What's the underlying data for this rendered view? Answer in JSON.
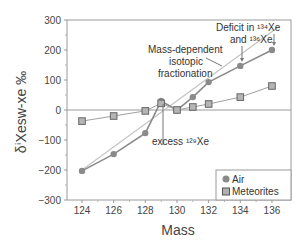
{
  "chart_data": {
    "type": "line",
    "title": "",
    "xlabel": "Mass",
    "ylabel": "δⁱXesw-xe ‰",
    "xlim": [
      123.1,
      137.1
    ],
    "ylim": [
      -300,
      300
    ],
    "x_ticks": [
      124,
      126,
      128,
      130,
      132,
      134,
      136
    ],
    "y_ticks": [
      300,
      200,
      100,
      0,
      -100,
      -200,
      -300
    ],
    "grid": false,
    "zero_line": true,
    "legend_position": "lower right",
    "series": [
      {
        "name": "Air",
        "marker": "circle",
        "color": "#8a8a8a",
        "x": [
          124,
          126,
          128,
          129,
          130,
          131,
          132,
          134,
          136
        ],
        "values": [
          -203,
          -147,
          -77,
          30,
          0,
          43,
          93,
          147,
          200
        ]
      },
      {
        "name": "Meteorites",
        "marker": "square",
        "color": "#a0a0a0",
        "x": [
          124,
          126,
          128,
          129,
          130,
          131,
          132,
          134,
          136
        ],
        "values": [
          -37,
          -20,
          -3,
          22,
          0,
          10,
          20,
          43,
          80
        ]
      }
    ],
    "reference_line": {
      "name": "Mass-dependent isotopic fractionation",
      "x": [
        124,
        136.4
      ],
      "values": [
        -200,
        277
      ]
    },
    "annotations": [
      {
        "text_lines": [
          "Deficit in ¹³⁴Xe",
          "and ¹³⁶Xe"
        ]
      },
      {
        "text_lines": [
          "Mass-dependent",
          "isotopic",
          "fractionation"
        ]
      },
      {
        "text_lines": [
          "excess ¹²⁹Xe"
        ]
      }
    ]
  },
  "legend": {
    "items": [
      {
        "label": "Air"
      },
      {
        "label": "Meteorites"
      }
    ]
  },
  "labels": {
    "xlabel": "Mass",
    "ylabel": "δⁱXesw-xe  ‰",
    "deficit_line1": "Deficit in ¹³⁴Xe",
    "deficit_line2": "and ¹³⁶Xe",
    "frac_line1": "Mass-dependent",
    "frac_line2": "isotopic",
    "frac_line3": "fractionation",
    "excess": "excess ¹²⁹Xe"
  }
}
